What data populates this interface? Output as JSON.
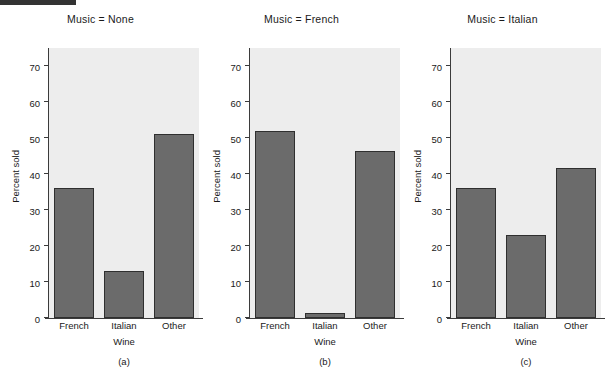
{
  "figure": {
    "artifact_bar": "scan-edge-artifact"
  },
  "colors": {
    "bar_fill": "#6b6b6b",
    "bar_edge": "#2f2f2f",
    "plot_background": "#ededed",
    "axis": "#3b3b3b",
    "page_background": "#ffffff"
  },
  "axis": {
    "ylabel": "Percent sold",
    "xlabel": "Wine",
    "yticks": [
      0,
      10,
      20,
      30,
      40,
      50,
      60,
      70
    ],
    "ytick_labels": [
      "0",
      "10",
      "20",
      "30",
      "40",
      "50",
      "60",
      "70"
    ],
    "ylim": [
      0,
      75
    ],
    "categories": [
      "French",
      "Italian",
      "Other"
    ]
  },
  "panels": [
    {
      "title": "Music = None",
      "caption": "(a)",
      "values": [
        36,
        13,
        51
      ]
    },
    {
      "title": "Music = French",
      "caption": "(b)",
      "values": [
        52,
        1.3,
        46.5
      ]
    },
    {
      "title": "Music = Italian",
      "caption": "(c)",
      "values": [
        36,
        23,
        41.7
      ]
    }
  ],
  "chart_data": {
    "type": "bar",
    "title": "",
    "subtitle": "",
    "xlabel": "Wine",
    "ylabel": "Percent sold",
    "ylim": [
      0,
      75
    ],
    "yticks": [
      0,
      10,
      20,
      30,
      40,
      50,
      60,
      70
    ],
    "grid": false,
    "legend": "none",
    "layout": "small-multiples-1x3",
    "categories": [
      "French",
      "Italian",
      "Other"
    ],
    "panels": [
      {
        "panel_label": "(a)",
        "condition": "Music = None",
        "categories": [
          "French",
          "Italian",
          "Other"
        ],
        "values": [
          36,
          13,
          51
        ]
      },
      {
        "panel_label": "(b)",
        "condition": "Music = French",
        "categories": [
          "French",
          "Italian",
          "Other"
        ],
        "values": [
          52,
          1.3,
          46.5
        ]
      },
      {
        "panel_label": "(c)",
        "condition": "Music = Italian",
        "categories": [
          "French",
          "Italian",
          "Other"
        ],
        "values": [
          36,
          23,
          41.7
        ]
      }
    ],
    "series": [
      {
        "name": "Music = None",
        "values": [
          36,
          13,
          51
        ]
      },
      {
        "name": "Music = French",
        "values": [
          52,
          1.3,
          46.5
        ]
      },
      {
        "name": "Music = Italian",
        "values": [
          36,
          23,
          41.7
        ]
      }
    ]
  }
}
